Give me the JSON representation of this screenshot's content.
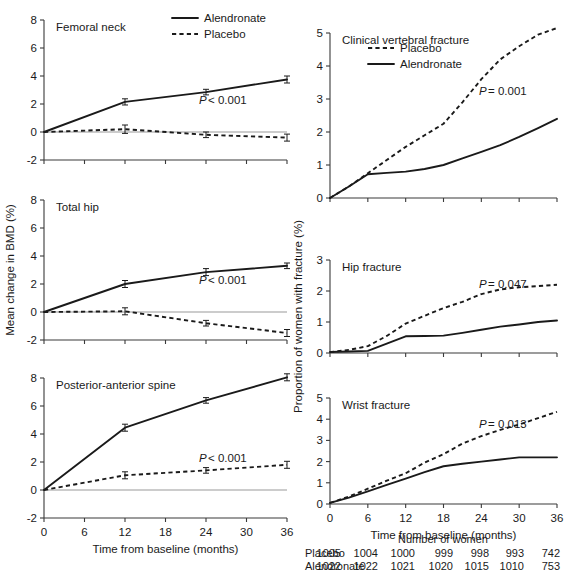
{
  "figure": {
    "left_axis_title": "Mean change in BMD (%)",
    "right_axis_title": "Proportion of women with fracture (%)",
    "x_axis_title": "Time from baseline (months)",
    "x_ticks": [
      "0",
      "6",
      "12",
      "18",
      "24",
      "30",
      "36"
    ],
    "x_values": [
      0,
      6,
      12,
      18,
      24,
      30,
      36
    ],
    "colors": {
      "line": "#1a1a1a",
      "axis": "#3a3a3a",
      "zero_line": "#9a9a9a",
      "background": "#ffffff"
    }
  },
  "legend_left": {
    "items": [
      {
        "label": "Alendronate",
        "style": "solid"
      },
      {
        "label": "Placebo",
        "style": "dashed"
      }
    ]
  },
  "legend_right": {
    "items": [
      {
        "label": "Placebo",
        "style": "dashed"
      },
      {
        "label": "Alendronate",
        "style": "solid"
      }
    ]
  },
  "panels": {
    "femoral_neck": {
      "title": "Femoral neck",
      "pvalue": "P < 0.001",
      "pvalue_symbol": "P",
      "pvalue_rest": "< 0.001",
      "y_ticks": [
        "8",
        "6",
        "4",
        "2",
        "0",
        "-2"
      ],
      "y_tick_values": [
        8,
        6,
        4,
        2,
        0,
        -2
      ]
    },
    "total_hip": {
      "title": "Total hip",
      "pvalue": "P < 0.001",
      "pvalue_symbol": "P",
      "pvalue_rest": "< 0.001",
      "y_ticks": [
        "8",
        "6",
        "4",
        "2",
        "0",
        "-2"
      ],
      "y_tick_values": [
        8,
        6,
        4,
        2,
        0,
        -2
      ]
    },
    "pa_spine": {
      "title": "Posterior-anterior spine",
      "pvalue": "P < 0.001",
      "pvalue_symbol": "P",
      "pvalue_rest": "< 0.001",
      "y_ticks": [
        "8",
        "6",
        "4",
        "2",
        "0",
        "-2"
      ],
      "y_tick_values": [
        8,
        6,
        4,
        2,
        0,
        -2
      ]
    },
    "clinical_vertebral": {
      "title": "Clinical vertebral fracture",
      "pvalue": "P = 0.001",
      "pvalue_symbol": "P",
      "pvalue_rest": "= 0.001",
      "y_ticks": [
        "5",
        "4",
        "3",
        "2",
        "1",
        "0"
      ],
      "y_tick_values": [
        5,
        4,
        3,
        2,
        1,
        0
      ]
    },
    "hip_fracture": {
      "title": "Hip fracture",
      "pvalue": "P = 0.047",
      "pvalue_symbol": "P",
      "pvalue_rest": "= 0.047",
      "y_ticks": [
        "3",
        "2",
        "1",
        "0"
      ],
      "y_tick_values": [
        3,
        2,
        1,
        0
      ]
    },
    "wrist_fracture": {
      "title": "Wrist fracture",
      "pvalue": "P = 0.013",
      "pvalue_symbol": "P",
      "pvalue_rest": "= 0.013",
      "y_ticks": [
        "5",
        "4",
        "3",
        "2",
        "1",
        "0"
      ],
      "y_tick_values": [
        5,
        4,
        3,
        2,
        1,
        0
      ]
    }
  },
  "number_at_risk": {
    "heading": "Number of women",
    "rows": [
      {
        "label": "Placebo",
        "values": [
          "1005",
          "1004",
          "1000",
          "999",
          "998",
          "993",
          "742"
        ]
      },
      {
        "label": "Alendronate",
        "values": [
          "1022",
          "1022",
          "1021",
          "1020",
          "1015",
          "1010",
          "753"
        ]
      }
    ]
  },
  "chart_data": [
    {
      "type": "line",
      "title": "Femoral neck",
      "xlabel": "Time from baseline (months)",
      "ylabel": "Mean change in BMD (%)",
      "xlim": [
        0,
        36
      ],
      "ylim": [
        -2,
        8
      ],
      "grid": false,
      "legend_position": "top-right",
      "x": [
        0,
        12,
        24,
        36
      ],
      "series": [
        {
          "name": "Alendronate",
          "style": "solid",
          "values": [
            0.0,
            2.15,
            2.85,
            3.75
          ],
          "errors": [
            0.0,
            0.22,
            0.2,
            0.25
          ]
        },
        {
          "name": "Placebo",
          "style": "dashed",
          "values": [
            0.0,
            0.2,
            -0.2,
            -0.4
          ],
          "errors": [
            0.0,
            0.3,
            0.2,
            0.25
          ]
        }
      ],
      "annotations": [
        "P < 0.001"
      ]
    },
    {
      "type": "line",
      "title": "Total hip",
      "xlabel": "Time from baseline (months)",
      "ylabel": "Mean change in BMD (%)",
      "xlim": [
        0,
        36
      ],
      "ylim": [
        -2,
        8
      ],
      "grid": false,
      "x": [
        0,
        12,
        24,
        36
      ],
      "series": [
        {
          "name": "Alendronate",
          "style": "solid",
          "values": [
            0.0,
            2.0,
            2.85,
            3.3
          ],
          "errors": [
            0.0,
            0.25,
            0.25,
            0.2
          ]
        },
        {
          "name": "Placebo",
          "style": "dashed",
          "values": [
            0.0,
            0.05,
            -0.8,
            -1.5
          ],
          "errors": [
            0.0,
            0.25,
            0.2,
            0.25
          ]
        }
      ],
      "annotations": [
        "P < 0.001"
      ]
    },
    {
      "type": "line",
      "title": "Posterior-anterior spine",
      "xlabel": "Time from baseline (months)",
      "ylabel": "Mean change in BMD (%)",
      "xlim": [
        0,
        36
      ],
      "ylim": [
        -2,
        8
      ],
      "grid": false,
      "x": [
        0,
        12,
        24,
        36
      ],
      "series": [
        {
          "name": "Alendronate",
          "style": "solid",
          "values": [
            0.0,
            4.45,
            6.4,
            8.05
          ],
          "errors": [
            0.0,
            0.25,
            0.2,
            0.25
          ]
        },
        {
          "name": "Placebo",
          "style": "dashed",
          "values": [
            0.0,
            1.05,
            1.4,
            1.8
          ],
          "errors": [
            0.0,
            0.25,
            0.2,
            0.25
          ]
        }
      ],
      "annotations": [
        "P < 0.001"
      ]
    },
    {
      "type": "line",
      "title": "Clinical vertebral fracture",
      "xlabel": "Time from baseline (months)",
      "ylabel": "Proportion of women with fracture (%)",
      "xlim": [
        0,
        36
      ],
      "ylim": [
        0,
        5
      ],
      "grid": false,
      "legend_position": "top-left",
      "x": [
        0,
        3,
        6,
        9,
        12,
        15,
        18,
        21,
        24,
        27,
        30,
        33,
        36
      ],
      "series": [
        {
          "name": "Placebo",
          "style": "dashed",
          "values": [
            0.0,
            0.35,
            0.75,
            1.15,
            1.55,
            1.9,
            2.25,
            2.9,
            3.6,
            4.2,
            4.6,
            4.95,
            5.15
          ]
        },
        {
          "name": "Alendronate",
          "style": "solid",
          "values": [
            0.0,
            0.35,
            0.72,
            0.76,
            0.8,
            0.88,
            1.0,
            1.2,
            1.4,
            1.6,
            1.85,
            2.12,
            2.4
          ]
        }
      ],
      "annotations": [
        "P = 0.001"
      ]
    },
    {
      "type": "line",
      "title": "Hip fracture",
      "xlabel": "Time from baseline (months)",
      "ylabel": "Proportion of women with fracture (%)",
      "xlim": [
        0,
        36
      ],
      "ylim": [
        0,
        3
      ],
      "grid": false,
      "x": [
        0,
        3,
        6,
        9,
        12,
        15,
        18,
        21,
        24,
        27,
        30,
        33,
        36
      ],
      "series": [
        {
          "name": "Placebo",
          "style": "dashed",
          "values": [
            0.03,
            0.1,
            0.22,
            0.55,
            0.95,
            1.2,
            1.45,
            1.65,
            1.9,
            2.05,
            2.12,
            2.16,
            2.2
          ]
        },
        {
          "name": "Alendronate",
          "style": "solid",
          "values": [
            0.03,
            0.05,
            0.07,
            0.3,
            0.54,
            0.55,
            0.56,
            0.65,
            0.75,
            0.85,
            0.92,
            1.0,
            1.05
          ]
        }
      ],
      "annotations": [
        "P = 0.047"
      ]
    },
    {
      "type": "line",
      "title": "Wrist fracture",
      "xlabel": "Time from baseline (months)",
      "ylabel": "Proportion of women with fracture (%)",
      "xlim": [
        0,
        36
      ],
      "ylim": [
        0,
        5
      ],
      "grid": false,
      "x": [
        0,
        3,
        6,
        9,
        12,
        15,
        18,
        21,
        24,
        27,
        30,
        33,
        36
      ],
      "series": [
        {
          "name": "Placebo",
          "style": "dashed",
          "values": [
            0.05,
            0.35,
            0.72,
            1.1,
            1.45,
            1.95,
            2.35,
            2.85,
            3.2,
            3.5,
            3.75,
            4.05,
            4.35
          ]
        },
        {
          "name": "Alendronate",
          "style": "solid",
          "values": [
            0.05,
            0.3,
            0.6,
            0.9,
            1.2,
            1.5,
            1.78,
            1.9,
            2.0,
            2.1,
            2.2,
            2.2,
            2.2
          ]
        }
      ],
      "annotations": [
        "P = 0.013"
      ]
    }
  ]
}
